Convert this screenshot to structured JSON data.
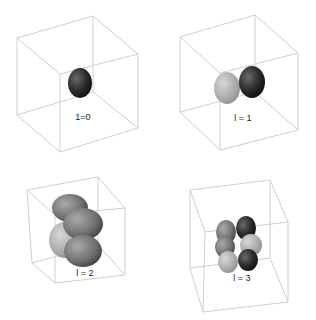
{
  "figure": {
    "panels": [
      {
        "id": "l0",
        "label": "1=0",
        "lobes": 1
      },
      {
        "id": "l1",
        "label": "l = 1",
        "lobes": 2
      },
      {
        "id": "l2",
        "label": "l = 2",
        "lobes": 4
      },
      {
        "id": "l3",
        "label": "l = 3",
        "lobes": 6
      }
    ]
  },
  "colors": {
    "background": "#ffffff",
    "cube_edge": "#cfcfcf",
    "dark_lobe": "#2a2a2a",
    "light_lobe": "#b5b5b5",
    "mid_lobe": "#777777"
  }
}
